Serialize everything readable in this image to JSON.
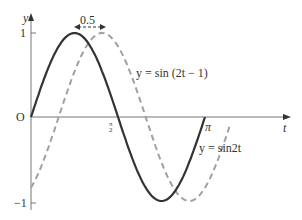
{
  "chart_data": {
    "type": "line",
    "title": "",
    "xlabel": "t",
    "ylabel": "y",
    "xlim": [
      0,
      3.3
    ],
    "ylim": [
      -1,
      1
    ],
    "grid": false,
    "x_ticks": [
      {
        "value": 1.5708,
        "label": "π/2"
      },
      {
        "value": 3.1416,
        "label": "π"
      }
    ],
    "y_ticks": [
      {
        "value": 1,
        "label": "1"
      },
      {
        "value": 0,
        "label": "O"
      },
      {
        "value": -1,
        "label": "-1"
      }
    ],
    "series": [
      {
        "name": "y = sin2t",
        "style": "solid",
        "color": "#333333",
        "x_range": [
          0,
          3.1416
        ],
        "expression": "sin(2t)"
      },
      {
        "name": "y = sin (2t − 1)",
        "style": "dashed",
        "color": "#999999",
        "x_range": [
          0,
          3.6
        ],
        "expression": "sin(2t-1)"
      }
    ],
    "annotations": [
      {
        "text": "0.5",
        "type": "double-arrow",
        "between": "peaks"
      }
    ]
  },
  "labels": {
    "y_axis": "y",
    "t_axis": "t",
    "one": "1",
    "origin": "O",
    "neg_one": "−1",
    "pi": "π",
    "half_pi_num": "π",
    "half_pi_den": "2",
    "shift": "0.5",
    "curve1": "y = sin2t",
    "curve2": "y = sin (2t − 1)"
  }
}
